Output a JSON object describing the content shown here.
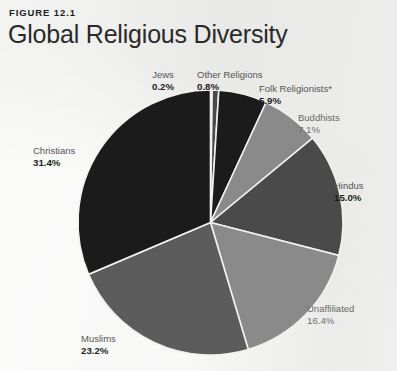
{
  "figure": {
    "kicker": "FIGURE 12.1",
    "title": "Global Religious Diversity"
  },
  "palette": {
    "background": "#f1f1ef",
    "slice_black": "#1b1b1b",
    "slice_dark_gray": "#4a4a4a",
    "slice_mid_gray": "#8a8a8a",
    "slice_light_gray": "#9a9a9a",
    "slice_divider": "#f1f1ef",
    "label_name": "#545454",
    "label_value": "#1d1d1d"
  },
  "chart_data": {
    "type": "pie",
    "title": "Global Religious Diversity",
    "subtitle": "",
    "xlabel": "",
    "ylabel": "",
    "grid": false,
    "legend_position": "callouts-around-pie",
    "start_angle_deg": 0,
    "direction": "clockwise",
    "units": "percent",
    "total": 100.0,
    "footnote_marker": "*",
    "labels": [
      "Jews",
      "Other Religions",
      "Folk Religionists*",
      "Buddhists",
      "Hindus",
      "Unaffiliated",
      "Muslims",
      "Christians"
    ],
    "values": [
      0.2,
      0.8,
      5.9,
      7.1,
      15.0,
      16.4,
      23.2,
      31.4
    ],
    "value_labels": [
      "0.2%",
      "0.8%",
      "5.9%",
      "7.1%",
      "15.0%",
      "16.4%",
      "23.2%",
      "31.4%"
    ],
    "slices": [
      {
        "label": "Jews",
        "value": 0.2,
        "value_label": "0.2%",
        "color": "#8f8f8f",
        "label_style": "bold"
      },
      {
        "label": "Other Religions",
        "value": 0.8,
        "value_label": "0.8%",
        "color": "#4a4a4a",
        "label_style": "bold"
      },
      {
        "label": "Folk Religionists*",
        "value": 5.9,
        "value_label": "5.9%",
        "color": "#1b1b1b",
        "label_style": "bold"
      },
      {
        "label": "Buddhists",
        "value": 7.1,
        "value_label": "7.1%",
        "color": "#8a8a8a",
        "label_style": "soft"
      },
      {
        "label": "Hindus",
        "value": 15.0,
        "value_label": "15.0%",
        "color": "#4a4a4a",
        "label_style": "bold"
      },
      {
        "label": "Unaffiliated",
        "value": 16.4,
        "value_label": "16.4%",
        "color": "#8a8a8a",
        "label_style": "soft"
      },
      {
        "label": "Muslims",
        "value": 23.2,
        "value_label": "23.2%",
        "color": "#5c5c5c",
        "label_style": "bold"
      },
      {
        "label": "Christians",
        "value": 31.4,
        "value_label": "31.4%",
        "color": "#1b1b1b",
        "label_style": "bold"
      }
    ]
  }
}
